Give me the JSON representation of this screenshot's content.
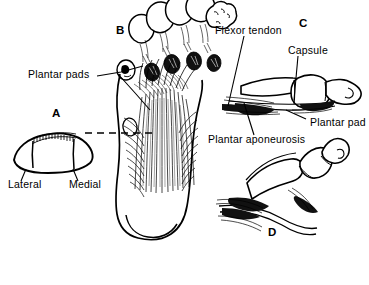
{
  "figure": {
    "background_color": "#ffffff",
    "ink_color": "#000000",
    "width": 369,
    "height": 285
  },
  "panels": [
    {
      "letter": "A",
      "name": "cross-section-of-plantar-pad",
      "description": "Transverse cross-section through the forefoot pad showing lateral and medial compartments with hatched superficial layer"
    },
    {
      "letter": "B",
      "name": "plantar-view-of-foot",
      "description": "Plantar (sole) view of the foot showing toe plantar pads and the longitudinal fibers of the plantar aponeurosis"
    },
    {
      "letter": "C",
      "name": "sagittal-section-toe-extended",
      "description": "Sagittal section of a toe in extension showing flexor tendon, joint capsule and plantar pad"
    },
    {
      "letter": "D",
      "name": "sagittal-section-toe-flexed",
      "description": "Sagittal section of a toe in flexion"
    }
  ],
  "labels": {
    "plantar_pads": "Plantar pads",
    "lateral": "Lateral",
    "medial": "Medial",
    "flexor_tendon": "Flexor tendon",
    "capsule": "Capsule",
    "plantar_pad": "Plantar pad",
    "plantar_aponeurosis": "Plantar aponeurosis"
  },
  "panel_letters": {
    "a": "A",
    "b": "B",
    "c": "C",
    "d": "D"
  },
  "annotations": {
    "section_line": "dashed transverse section level line linking panel A to panel B"
  }
}
